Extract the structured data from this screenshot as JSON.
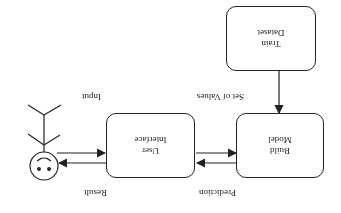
{
  "diagram": {
    "orientation": "rotated-180",
    "nodes": {
      "train_dataset": {
        "line1": "Train",
        "line2": "Dataset"
      },
      "build_model": {
        "line1": "Build",
        "line2": "Model"
      },
      "user_interface": {
        "line1": "User",
        "line2": "Interface"
      },
      "user": {
        "label": "User (actor)"
      }
    },
    "edges": {
      "input": "Input",
      "result": "Result",
      "set_of_values": "Set of Values",
      "prediction": "Prediction"
    },
    "colors": {
      "stroke": "#222222",
      "background": "#ffffff"
    }
  }
}
